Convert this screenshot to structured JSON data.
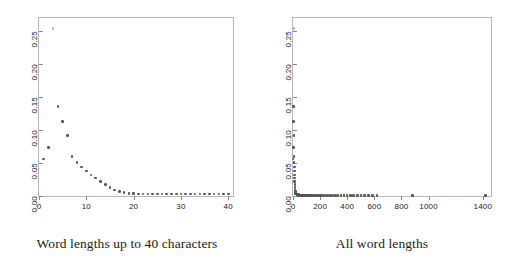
{
  "figure": {
    "background": "#ffffff",
    "point_color": "#555555",
    "frame_color": "#b9b9b9"
  },
  "panels": [
    {
      "caption": "Word lengths up to 40 characters"
    },
    {
      "caption": "All word lengths"
    }
  ],
  "chart_data": [
    {
      "type": "scatter",
      "title": "Word lengths up to 40 characters",
      "xlabel": "",
      "ylabel": "",
      "xlim": [
        0,
        41
      ],
      "ylim": [
        0,
        0.27
      ],
      "xticks": [
        0,
        10,
        20,
        30,
        40
      ],
      "yticks": [
        0.0,
        0.05,
        0.1,
        0.15,
        0.2,
        0.25
      ],
      "xtick_labels": [
        "0",
        "10",
        "20",
        "30",
        "40"
      ],
      "ytick_labels": [
        "0.00",
        "0.05",
        "0.10",
        "0.15",
        "0.20",
        "0.25"
      ],
      "grid": false,
      "legend": null,
      "x": [
        1,
        2,
        3,
        4,
        5,
        6,
        7,
        8,
        9,
        10,
        11,
        12,
        13,
        14,
        15,
        16,
        17,
        18,
        19,
        20,
        21,
        22,
        23,
        24,
        25,
        26,
        27,
        28,
        29,
        30,
        31,
        32,
        33,
        34,
        35,
        36,
        37,
        38,
        39,
        40
      ],
      "y": [
        0.056,
        0.074,
        0.254,
        0.136,
        0.113,
        0.092,
        0.06,
        0.051,
        0.044,
        0.038,
        0.032,
        0.027,
        0.022,
        0.017,
        0.013,
        0.009,
        0.007,
        0.005,
        0.004,
        0.004,
        0.003,
        0.003,
        0.003,
        0.003,
        0.003,
        0.003,
        0.003,
        0.003,
        0.003,
        0.003,
        0.003,
        0.003,
        0.003,
        0.003,
        0.003,
        0.003,
        0.003,
        0.003,
        0.003,
        0.003
      ]
    },
    {
      "type": "scatter",
      "title": "All word lengths",
      "xlabel": "",
      "ylabel": "",
      "xlim": [
        0,
        1460
      ],
      "ylim": [
        0,
        0.27
      ],
      "xticks": [
        0,
        200,
        400,
        600,
        800,
        1000,
        1400
      ],
      "yticks": [
        0.0,
        0.05,
        0.1,
        0.15,
        0.2,
        0.25
      ],
      "xtick_labels": [
        "0",
        "200",
        "400",
        "600",
        "800",
        "1000",
        "1400"
      ],
      "ytick_labels": [
        "0.00",
        "0.05",
        "0.10",
        "0.15",
        "0.20",
        "0.25"
      ],
      "grid": false,
      "legend": null,
      "x": [
        1,
        2,
        3,
        4,
        5,
        6,
        7,
        8,
        9,
        10,
        11,
        12,
        13,
        14,
        15,
        16,
        17,
        18,
        19,
        20,
        22,
        24,
        26,
        28,
        30,
        33,
        36,
        39,
        42,
        45,
        48,
        52,
        56,
        60,
        65,
        70,
        75,
        80,
        86,
        92,
        98,
        105,
        112,
        120,
        128,
        137,
        146,
        156,
        166,
        177,
        189,
        201,
        214,
        228,
        243,
        259,
        276,
        294,
        313,
        333,
        354,
        376,
        399,
        423,
        448,
        474,
        501,
        529,
        558,
        588,
        619,
        880,
        1420
      ],
      "y": [
        0.056,
        0.074,
        0.254,
        0.136,
        0.113,
        0.092,
        0.06,
        0.051,
        0.044,
        0.038,
        0.032,
        0.027,
        0.022,
        0.017,
        0.013,
        0.009,
        0.007,
        0.005,
        0.004,
        0.004,
        0.003,
        0.003,
        0.003,
        0.002,
        0.002,
        0.002,
        0.002,
        0.002,
        0.001,
        0.001,
        0.001,
        0.001,
        0.001,
        0.001,
        0.001,
        0.001,
        0.001,
        0.001,
        0.001,
        0.001,
        0.001,
        0.001,
        0.001,
        0.001,
        0.001,
        0.001,
        0.001,
        0.001,
        0.001,
        0.001,
        0.001,
        0.001,
        0.001,
        0.001,
        0.001,
        0.001,
        0.001,
        0.001,
        0.001,
        0.001,
        0.001,
        0.001,
        0.001,
        0.001,
        0.001,
        0.001,
        0.001,
        0.001,
        0.001,
        0.001,
        0.001,
        0.001,
        0.001
      ]
    }
  ]
}
